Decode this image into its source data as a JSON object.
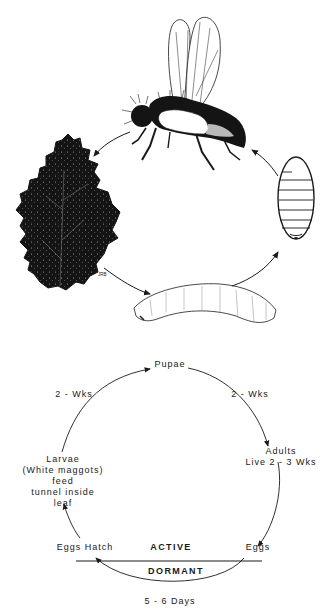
{
  "illustration": {
    "stages": [
      {
        "id": "adult",
        "name": "Adult fly"
      },
      {
        "id": "leaf",
        "name": "Mined leaf",
        "signature": "JRB"
      },
      {
        "id": "larva",
        "name": "Larva (maggot)"
      },
      {
        "id": "pupa",
        "name": "Pupa"
      }
    ]
  },
  "cycle": {
    "pupae": "Pupae",
    "larvae_to_pupae": "2 - Wks",
    "pupae_to_adults": "2 - Wks",
    "adults": {
      "line1": "Adults",
      "line2": "Live 2 - 3 Wks"
    },
    "larvae": {
      "line1": "Larvae",
      "line2": "(White maggots)",
      "line3": "feed",
      "line4": "tunnel inside",
      "line5": "leaf"
    },
    "eggs_hatch": "Eggs Hatch",
    "eggs": "Eggs",
    "active": "ACTIVE",
    "dormant": "DORMANT",
    "eggs_duration": "5 - 6 Days"
  }
}
